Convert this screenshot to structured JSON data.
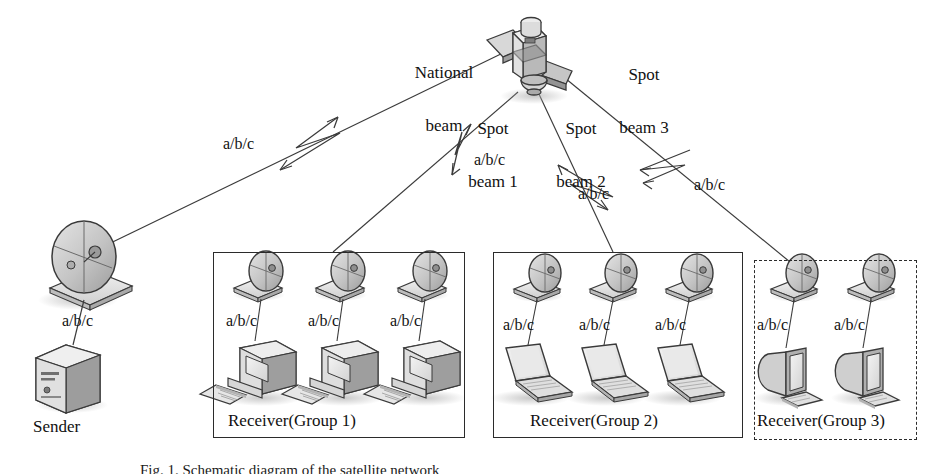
{
  "figure": {
    "type": "network-diagram",
    "caption": "Fig. 1.  Schematic diagram of the satellite network",
    "width": 943,
    "height": 474,
    "colors": {
      "line": "#2b2b2b",
      "text": "#111111",
      "box_solid": "#2b2b2b",
      "box_dashed": "#2b2b2b",
      "icon_fill": "#c9c9c9",
      "icon_light": "#e8e8e8",
      "icon_dark": "#8f8f8f",
      "icon_stroke": "#3a3a3a",
      "shadow": "#b9b9b9",
      "background": "#ffffff"
    }
  },
  "beams": {
    "national": {
      "label": "National\nbeam",
      "label_line1": "National",
      "label_line2": "beam",
      "flow_label": "a/b/c"
    },
    "spot1": {
      "label_line1": "Spot",
      "label_line2": "beam 1",
      "flow_label": "a/b/c"
    },
    "spot2": {
      "label_line1": "Spot",
      "label_line2": "beam 2",
      "flow_label": "a/b/c"
    },
    "spot3": {
      "label_line1": "Spot",
      "label_line2": "beam 3",
      "flow_label": "a/b/c"
    }
  },
  "satellite": {
    "name": "satellite-icon"
  },
  "sender": {
    "label": "Sender",
    "link_label": "a/b/c",
    "dish_name": "satellite-dish-icon",
    "server_name": "server-tower-icon"
  },
  "groups": [
    {
      "id": "group1",
      "label": "Receiver(Group 1)",
      "border": "solid",
      "terminal_type": "desktop-pc",
      "receivers": [
        {
          "link_label": "a/b/c"
        },
        {
          "link_label": "a/b/c"
        },
        {
          "link_label": "a/b/c"
        }
      ]
    },
    {
      "id": "group2",
      "label": "Receiver(Group 2)",
      "border": "solid",
      "terminal_type": "laptop",
      "receivers": [
        {
          "link_label": "a/b/c"
        },
        {
          "link_label": "a/b/c"
        },
        {
          "link_label": "a/b/c"
        }
      ]
    },
    {
      "id": "group3",
      "label": "Receiver(Group 3)",
      "border": "dashed",
      "terminal_type": "crt-monitor",
      "receivers": [
        {
          "link_label": "a/b/c"
        },
        {
          "link_label": "a/b/c"
        }
      ]
    }
  ]
}
